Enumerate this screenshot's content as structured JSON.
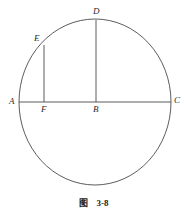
{
  "figure": {
    "caption_label": "图",
    "caption_number": "3-8",
    "stroke_color": "#4a4a4a",
    "label_color": "#2b2b2b",
    "background_color": "#ffffff",
    "circle": {
      "center_x": 95,
      "center_y": 102,
      "radius_x": 76,
      "radius_y": 83
    },
    "points": [
      {
        "id": "A",
        "label": "A",
        "x": 19,
        "y": 102,
        "label_x": 9,
        "label_y": 97
      },
      {
        "id": "B",
        "label": "B",
        "x": 96,
        "y": 102,
        "label_x": 93,
        "label_y": 105
      },
      {
        "id": "C",
        "label": "C",
        "x": 171,
        "y": 102,
        "label_x": 174,
        "label_y": 96
      },
      {
        "id": "D",
        "label": "D",
        "x": 96,
        "y": 20,
        "label_x": 93,
        "label_y": 7
      },
      {
        "id": "E",
        "label": "E",
        "x": 44,
        "y": 45,
        "label_x": 34,
        "label_y": 34
      },
      {
        "id": "F",
        "label": "F",
        "x": 44,
        "y": 102,
        "label_x": 41,
        "label_y": 105
      }
    ],
    "segments": [
      {
        "id": "AC",
        "from": "A",
        "to": "C",
        "x1": 19,
        "y1": 102,
        "x2": 171,
        "y2": 102
      },
      {
        "id": "DB",
        "from": "D",
        "to": "B",
        "x1": 96,
        "y1": 20,
        "x2": 96,
        "y2": 102
      },
      {
        "id": "EF",
        "from": "E",
        "to": "F",
        "x1": 44,
        "y1": 45,
        "x2": 44,
        "y2": 102
      }
    ]
  }
}
